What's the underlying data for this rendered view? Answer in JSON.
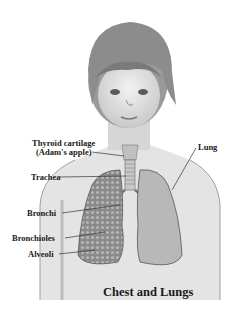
{
  "figure": {
    "title": "Chest and Lungs",
    "labels": {
      "thyroid_line1": "Thyroid cartilage",
      "thyroid_line2": "(Adam's apple)",
      "trachea": "Trachea",
      "bronchi": "Bronchi",
      "bronchioles": "Bronchioles",
      "alveoli": "Alveoli",
      "lung": "Lung"
    }
  }
}
